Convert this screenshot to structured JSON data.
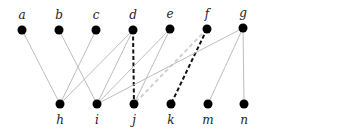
{
  "diagram": {
    "type": "bipartite-graph",
    "style": {
      "node_color": "#000000",
      "edge_color": "#bdbdbd",
      "highlight_edge_color": "#111111",
      "faint_dashed_color": "#d0d0d0",
      "node_radius": 4.5
    },
    "top_nodes": [
      {
        "id": "a",
        "label": "a",
        "x": 22,
        "y": 30
      },
      {
        "id": "b",
        "label": "b",
        "x": 59,
        "y": 30
      },
      {
        "id": "c",
        "label": "c",
        "x": 96,
        "y": 30
      },
      {
        "id": "d",
        "label": "d",
        "x": 133,
        "y": 30
      },
      {
        "id": "e",
        "label": "e",
        "x": 170,
        "y": 29
      },
      {
        "id": "f",
        "label": "f",
        "x": 207,
        "y": 29
      },
      {
        "id": "g",
        "label": "g",
        "x": 243,
        "y": 28
      }
    ],
    "bottom_nodes": [
      {
        "id": "h",
        "label": "h",
        "x": 60,
        "y": 104
      },
      {
        "id": "i",
        "label": "i",
        "x": 97,
        "y": 104
      },
      {
        "id": "j",
        "label": "j",
        "x": 134,
        "y": 104
      },
      {
        "id": "k",
        "label": "k",
        "x": 171,
        "y": 104
      },
      {
        "id": "m",
        "label": "m",
        "x": 208,
        "y": 104
      },
      {
        "id": "n",
        "label": "n",
        "x": 244,
        "y": 104
      }
    ],
    "edges": [
      {
        "from": "a",
        "to": "h",
        "style": "solid-light"
      },
      {
        "from": "b",
        "to": "i",
        "style": "solid-light"
      },
      {
        "from": "c",
        "to": "h",
        "style": "solid-light"
      },
      {
        "from": "d",
        "to": "h",
        "style": "solid-light"
      },
      {
        "from": "d",
        "to": "i",
        "style": "solid-light"
      },
      {
        "from": "d",
        "to": "j",
        "style": "dashed-dark"
      },
      {
        "from": "e",
        "to": "i",
        "style": "solid-light"
      },
      {
        "from": "e",
        "to": "j",
        "style": "solid-light"
      },
      {
        "from": "f",
        "to": "j",
        "style": "dashed-light"
      },
      {
        "from": "f",
        "to": "k",
        "style": "dashed-dark"
      },
      {
        "from": "g",
        "to": "i",
        "style": "solid-light"
      },
      {
        "from": "g",
        "to": "m",
        "style": "solid-light"
      },
      {
        "from": "g",
        "to": "n",
        "style": "solid-light"
      }
    ]
  }
}
